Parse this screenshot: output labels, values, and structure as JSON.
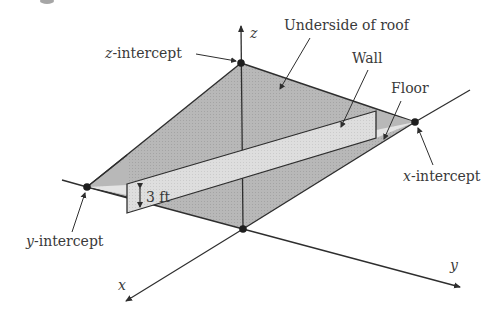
{
  "figure": {
    "heading_fragment": "",
    "axes": {
      "x_label": "x",
      "y_label": "y",
      "z_label": "z"
    },
    "labels": {
      "underside_of_roof": "Underside of roof",
      "wall": "Wall",
      "floor": "Floor",
      "z_intercept_var": "z",
      "z_intercept_suffix": "-intercept",
      "x_intercept_var": "x",
      "x_intercept_suffix": "-intercept",
      "y_intercept_var": "y",
      "y_intercept_suffix": "-intercept",
      "wall_height": "3 ft"
    },
    "points": {
      "origin": [
        243,
        229
      ],
      "z_intercept": [
        241,
        63
      ],
      "x_intercept": [
        415,
        122
      ],
      "y_intercept": [
        87,
        187
      ]
    },
    "colors": {
      "roof_fill": "#b4b4b4",
      "floor_fill": "#e6e6e6",
      "wall_fill": "#dcdcdc",
      "line": "#2e2e2e",
      "text": "#3a3a3a",
      "point": "#1e1e1e"
    }
  }
}
